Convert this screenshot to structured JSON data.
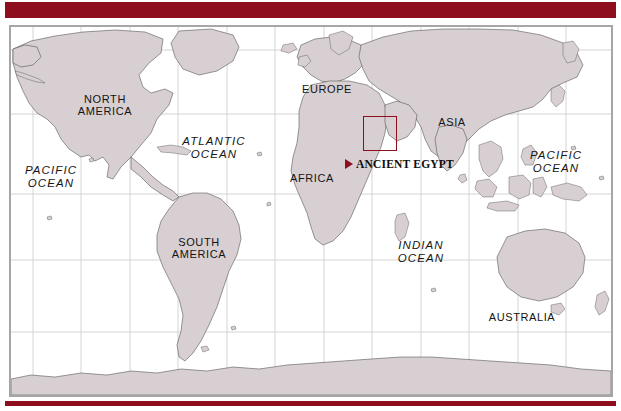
{
  "figure": {
    "kind": "world-map",
    "accent_color": "#8f0e1e",
    "land_color": "#d8cfd2",
    "ocean_color": "#ffffff",
    "graticule_color": "#c9c9c9",
    "frame_color": "#a6a6a6"
  },
  "bars": {
    "top_label": "",
    "bottom_label": ""
  },
  "map": {
    "continents": [
      {
        "id": "north-america",
        "label": "NORTH\nAMERICA",
        "x": 94,
        "y": 78
      },
      {
        "id": "south-america",
        "label": "SOUTH\nAMERICA",
        "x": 188,
        "y": 221
      },
      {
        "id": "europe",
        "label": "EUROPE",
        "x": 316,
        "y": 62
      },
      {
        "id": "africa",
        "label": "AFRICA",
        "x": 301,
        "y": 151
      },
      {
        "id": "asia",
        "label": "ASIA",
        "x": 441,
        "y": 95
      },
      {
        "id": "australia",
        "label": "AUSTRALIA",
        "x": 511,
        "y": 290
      },
      {
        "id": "antarctica",
        "label": "ANTARCTICA",
        "x": 455,
        "y": 383
      }
    ],
    "oceans": [
      {
        "id": "pacific-ocean-west",
        "label": "PACIFIC\nOCEAN",
        "x": 40,
        "y": 150
      },
      {
        "id": "atlantic-ocean",
        "label": "ATLANTIC\nOCEAN",
        "x": 203,
        "y": 121
      },
      {
        "id": "indian-ocean",
        "label": "INDIAN\nOCEAN",
        "x": 410,
        "y": 225
      },
      {
        "id": "pacific-ocean-east",
        "label": "PACIFIC\nOCEAN",
        "x": 545,
        "y": 135
      }
    ],
    "highlight": {
      "id": "ancient-egypt-box",
      "callout_label": "ANCIENT EGYPT",
      "marker_icon": "right-triangle-marker-icon",
      "box_x": 352,
      "box_y": 89,
      "box_w": 34,
      "box_h": 35
    },
    "graticule": {
      "vertical_x": [
        22,
        70,
        119,
        167,
        216,
        264,
        313,
        361,
        410,
        458,
        507,
        555
      ],
      "horizontal_y": [
        23,
        87,
        167,
        233,
        305,
        359
      ]
    }
  }
}
